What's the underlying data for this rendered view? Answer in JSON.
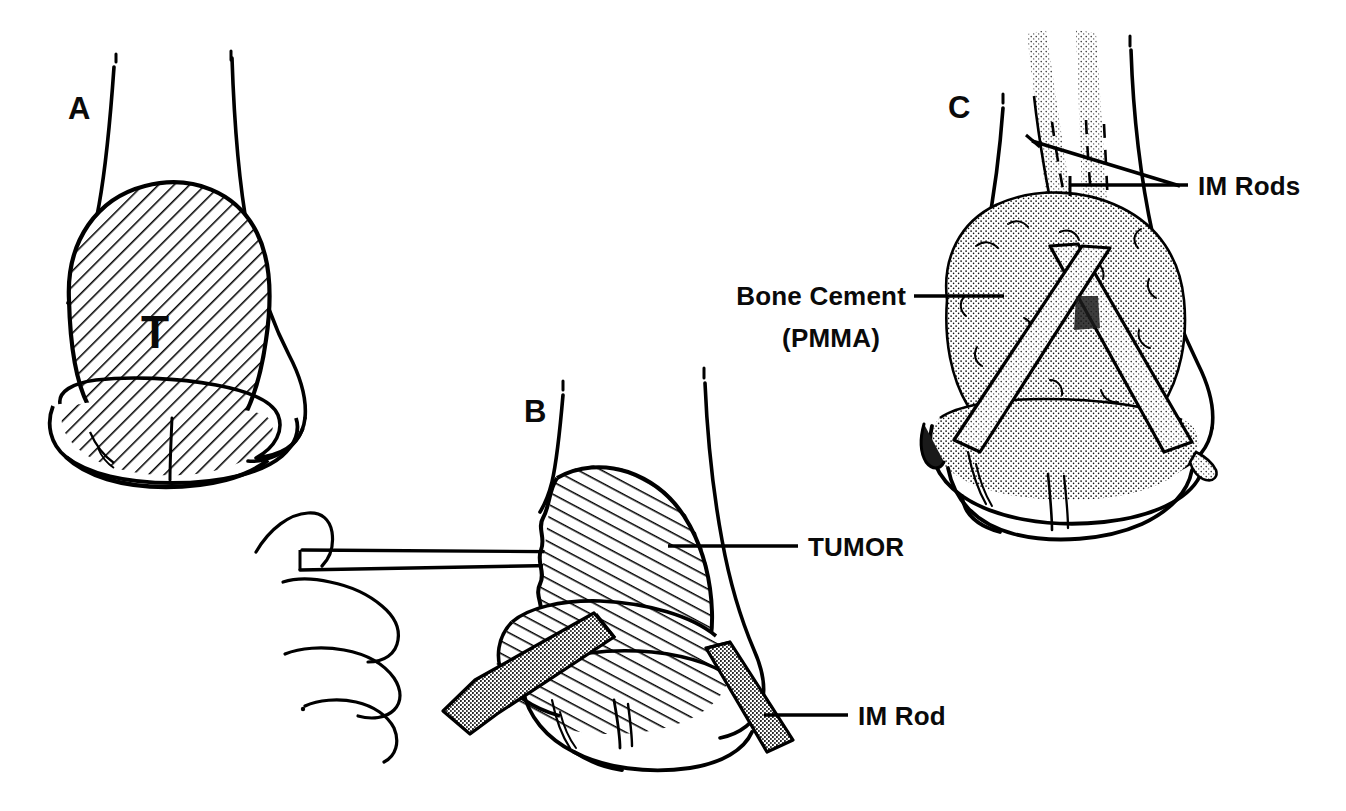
{
  "figure": {
    "background_color": "#ffffff",
    "ink_color": "#000000",
    "panel_count": 3
  },
  "panels": [
    {
      "id": "A",
      "letter": "A",
      "description": "Distal humerus with lytic tumor occupying the metaphysis and extending into the condyles, shown with diagonal hatching",
      "annotations": [
        {
          "id": "tumor-initial",
          "text": "T",
          "kind": "in-figure-letter",
          "x": 155,
          "y": 330
        }
      ],
      "hatch": {
        "style": "diagonal",
        "direction": "down-right",
        "angle_deg": 45,
        "spacing_px": 11
      }
    },
    {
      "id": "B",
      "letter": "B",
      "description": "Curettage of the tumor cavity with a loop curette held in the surgeon's hand; two intramedullary rods have been driven across the defect",
      "annotations": [
        {
          "id": "tumor-label",
          "text": "TUMOR",
          "kind": "callout",
          "label_x": 806,
          "label_y": 554,
          "leader_from_x": 798,
          "leader_from_y": 546,
          "leader_to_x": 670,
          "leader_to_y": 546
        },
        {
          "id": "im-rod-label",
          "text": "IM Rod",
          "kind": "callout",
          "label_x": 856,
          "label_y": 723,
          "leader_from_x": 848,
          "leader_from_y": 714,
          "leader_to_x": 762,
          "leader_to_y": 714
        }
      ],
      "instrument": {
        "name": "curette",
        "head_shape": "loop",
        "held_by": "hand"
      },
      "hatch": {
        "style": "diagonal",
        "direction": "down-left",
        "angle_deg": -62,
        "spacing_px": 11
      }
    },
    {
      "id": "C",
      "letter": "C",
      "description": "Completed reconstruction: two crossed intramedullary rods span the defect, which is packed with polymethylmethacrylate bone cement shown in stipple",
      "annotations": [
        {
          "id": "im-rods-label",
          "text": "IM Rods",
          "kind": "callout",
          "label_x": 1196,
          "label_y": 194,
          "leader_from_x": 1188,
          "leader_from_y": 185,
          "leader_to_x": 1070,
          "leader_to_y": 185
        },
        {
          "id": "bone-cement-label",
          "text_line_1": "Bone Cement",
          "text_line_2": "(PMMA)",
          "kind": "callout",
          "label_x": 906,
          "label_y": 303,
          "label_y2": 345,
          "leader_from_x": 914,
          "leader_from_y": 296,
          "leader_to_x": 1003,
          "leader_to_y": 296
        }
      ],
      "fill": {
        "style": "stipple",
        "material": "PMMA bone cement",
        "dot_spacing_px": 5
      },
      "rod_count": 2
    }
  ],
  "labels": {
    "panel_a": "A",
    "panel_b": "B",
    "panel_c": "C",
    "tumor_initial": "T",
    "tumor": "TUMOR",
    "im_rod_singular": "IM Rod",
    "im_rods_plural": "IM Rods",
    "bone_cement_line1": "Bone Cement",
    "bone_cement_line2": "(PMMA)"
  },
  "colors": {
    "ink": "#000000",
    "paper": "#ffffff",
    "rod_stipple": "#2a2a2a",
    "cement_stipple": "#1a1a1a"
  }
}
